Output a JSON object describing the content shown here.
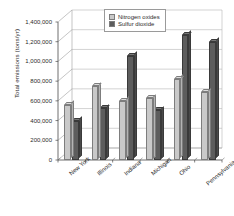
{
  "chart_data": {
    "type": "bar",
    "title": "",
    "xlabel": "",
    "ylabel": "Total emissions (tons/yr)",
    "ylim": [
      0,
      1400000
    ],
    "grid": true,
    "legend_position": "top-center",
    "categories": [
      "New York",
      "Illinois",
      "Indiana",
      "Michigan",
      "Ohio",
      "Pennsylvania"
    ],
    "ytick_labels": [
      "1,400,000",
      "1,200,000",
      "1,000,000",
      "800,000",
      "600,000",
      "400,000",
      "200,000",
      "0"
    ],
    "ytick_values": [
      1400000,
      1200000,
      1000000,
      800000,
      600000,
      400000,
      200000,
      0
    ],
    "series": [
      {
        "name": "Nitrogen oxides",
        "color": "#c9c9c9",
        "values": [
          560000,
          750000,
          600000,
          625000,
          825000,
          690000
        ]
      },
      {
        "name": "Sulfur dioxide",
        "color": "#5d5d5d",
        "values": [
          400000,
          525000,
          1060000,
          505000,
          1270000,
          1200000
        ]
      }
    ]
  }
}
